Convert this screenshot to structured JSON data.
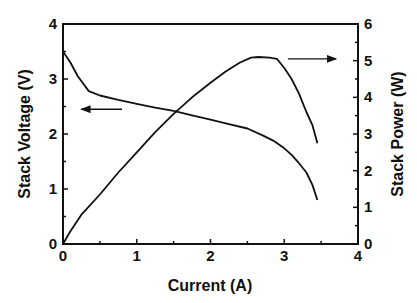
{
  "chart_data": {
    "type": "line",
    "title": "",
    "xlabel": "Current (A)",
    "ylabel": "Stack Voltage (V)",
    "y2label": "Stack Power (W)",
    "xlim": [
      0,
      4
    ],
    "ylim": [
      0,
      4
    ],
    "y2lim": [
      0,
      6
    ],
    "xticks": [
      "0",
      "1",
      "2",
      "3",
      "4"
    ],
    "yticks": [
      "0",
      "1",
      "2",
      "3",
      "4"
    ],
    "y2ticks": [
      "0",
      "1",
      "2",
      "3",
      "4",
      "5",
      "6"
    ],
    "grid": false,
    "legend": "none; arrows indicate axis association",
    "series": [
      {
        "name": "Stack Voltage",
        "axis": "left",
        "x": [
          0.0,
          0.1,
          0.2,
          0.35,
          0.5,
          0.75,
          1.0,
          1.25,
          1.5,
          1.75,
          2.0,
          2.25,
          2.5,
          2.7,
          2.85,
          3.0,
          3.1,
          3.2,
          3.3,
          3.38,
          3.45
        ],
        "values": [
          3.5,
          3.3,
          3.05,
          2.78,
          2.7,
          2.62,
          2.55,
          2.48,
          2.42,
          2.34,
          2.26,
          2.18,
          2.1,
          1.98,
          1.88,
          1.74,
          1.62,
          1.47,
          1.3,
          1.08,
          0.8
        ]
      },
      {
        "name": "Stack Power",
        "axis": "right",
        "x": [
          0.0,
          0.1,
          0.25,
          0.5,
          0.75,
          1.0,
          1.25,
          1.5,
          1.75,
          2.0,
          2.2,
          2.4,
          2.55,
          2.65,
          2.8,
          2.9,
          3.0,
          3.1,
          3.2,
          3.25,
          3.3,
          3.38,
          3.45
        ],
        "values": [
          0.0,
          0.35,
          0.8,
          1.35,
          1.95,
          2.5,
          3.05,
          3.55,
          4.0,
          4.4,
          4.7,
          4.95,
          5.08,
          5.1,
          5.08,
          5.05,
          4.8,
          4.5,
          4.1,
          3.85,
          3.6,
          3.25,
          2.75
        ]
      }
    ],
    "annotations": [
      {
        "type": "arrow",
        "direction": "left",
        "text": "",
        "at_x": [
          0.8,
          0.25
        ],
        "at_y_left": 2.45
      },
      {
        "type": "arrow",
        "direction": "right",
        "text": "",
        "at_x": [
          3.05,
          3.7
        ],
        "at_y_right": 5.05
      }
    ]
  },
  "labels": {
    "xlabel": "Current (A)",
    "ylabel": "Stack Voltage (V)",
    "y2label": "Stack Power (W)"
  },
  "colors": {
    "line": "#111111",
    "axis": "#111111",
    "background": "#ffffff"
  }
}
